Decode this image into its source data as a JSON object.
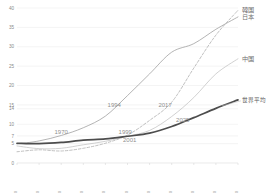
{
  "chart_data": {
    "type": "line",
    "title": "",
    "subtitle": "",
    "xlabel": "",
    "ylabel": "",
    "xlim": [
      1950,
      2050
    ],
    "ylim": [
      0,
      40
    ],
    "grid": true,
    "legend_position": "right-inline",
    "x_ticks": [
      1950,
      1960,
      1970,
      1980,
      1990,
      2000,
      2010,
      2020,
      2030,
      2040,
      2050
    ],
    "x_tick_labels": [
      "1950",
      "1960",
      "1970",
      "1980",
      "1990",
      "2000",
      "2010",
      "2020",
      "2030",
      "2040",
      "2050"
    ],
    "y_ticks": [
      0,
      5,
      7,
      10,
      14,
      15,
      20,
      25,
      30,
      35,
      40
    ],
    "y_tick_labels": [
      "0",
      "5",
      "7",
      "10",
      "14",
      "15",
      "20",
      "25",
      "30",
      "35",
      "40"
    ],
    "x": [
      1950,
      1960,
      1970,
      1980,
      1990,
      2000,
      2010,
      2020,
      2030,
      2040,
      2050
    ],
    "series": [
      {
        "name": "日本",
        "style": "solid-thin",
        "color": "#9b9b9b",
        "values": [
          4.9,
          5.7,
          7.1,
          9.1,
          12.1,
          17.4,
          23.0,
          28.6,
          30.8,
          34.5,
          37.7
        ]
      },
      {
        "name": "韓国",
        "style": "dashed",
        "color": "#b0b0b0",
        "values": [
          2.9,
          3.4,
          3.1,
          3.8,
          5.1,
          7.2,
          11.0,
          15.7,
          24.5,
          33.0,
          39.4
        ]
      },
      {
        "name": "中国",
        "style": "solid-light",
        "color": "#c2c2c2",
        "values": [
          4.4,
          3.7,
          3.8,
          4.7,
          5.6,
          6.9,
          8.4,
          12.0,
          16.9,
          23.0,
          26.9
        ]
      },
      {
        "name": "世界平均",
        "style": "solid-thick",
        "color": "#4d4d4d",
        "values": [
          5.1,
          5.0,
          5.3,
          5.9,
          6.2,
          6.9,
          7.7,
          9.4,
          11.7,
          14.1,
          16.3
        ]
      }
    ],
    "annotations": [
      {
        "label": "1970",
        "x": 1970,
        "y": 7,
        "series": "日本"
      },
      {
        "label": "1994",
        "x": 1994,
        "y": 14,
        "series": "日本"
      },
      {
        "label": "1999",
        "x": 1999,
        "y": 7,
        "series": "韓国"
      },
      {
        "label": "2001",
        "x": 2001,
        "y": 5,
        "series": "中国"
      },
      {
        "label": "2017",
        "x": 2017,
        "y": 14,
        "series": "韓国"
      },
      {
        "label": "2025",
        "x": 2025,
        "y": 10,
        "series": "世界平均"
      }
    ]
  }
}
